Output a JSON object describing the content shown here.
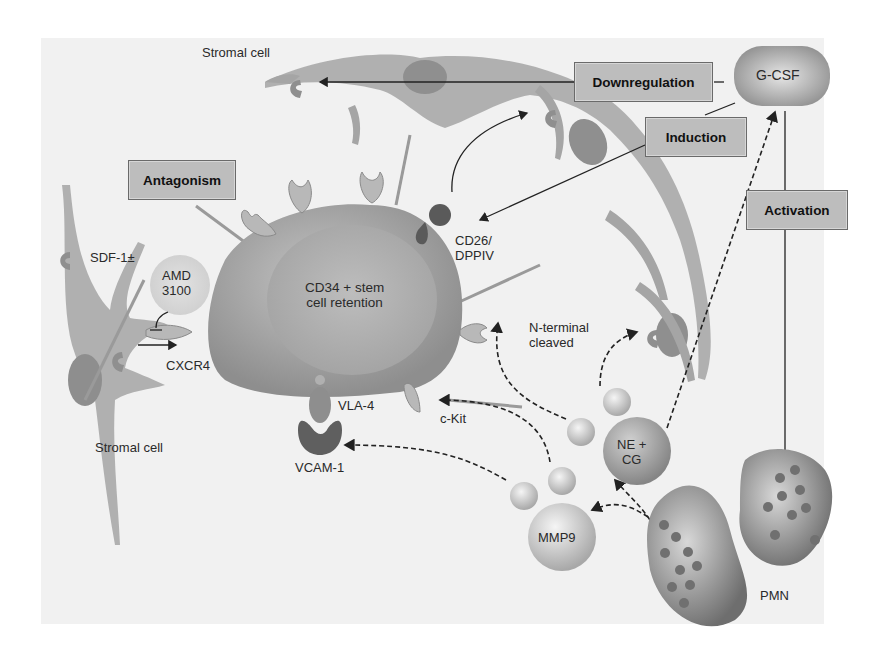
{
  "diagram": {
    "title_region": "Mechanism of CD34+ stem cell mobilization by G-CSF",
    "cells": {
      "stromal_top": "Stromal cell",
      "stromal_left": "Stromal cell",
      "stem_cell": "CD34 + stem cell retention",
      "stem_cell_line1": "CD34 + stem",
      "stem_cell_line2": "cell retention",
      "neutrophils": "PMN"
    },
    "molecules": {
      "sdf1": "SDF-1±",
      "amd_line1": "AMD",
      "amd_line2": "3100",
      "cxcr4": "CXCR4",
      "vla4": "VLA-4",
      "vcam1": "VCAM-1",
      "ckit": "c-Kit",
      "cd26_line1": "CD26/",
      "cd26_line2": "DPPIV",
      "nterm_line1": "N-terminal",
      "nterm_line2": "cleaved",
      "ne_line1": "NE +",
      "ne_line2": "CG",
      "mmp9": "MMP9",
      "gcsf": "G-CSF"
    },
    "process_boxes": {
      "antagonism": "Antagonism",
      "downregulation": "Downregulation",
      "induction": "Induction",
      "activation": "Activation"
    },
    "colors": {
      "panel_bg": "#f1f1f1",
      "box_fill": "#bdbdbd",
      "cell_gray": "#9a9a9a",
      "dark_receptor": "#555555"
    }
  }
}
